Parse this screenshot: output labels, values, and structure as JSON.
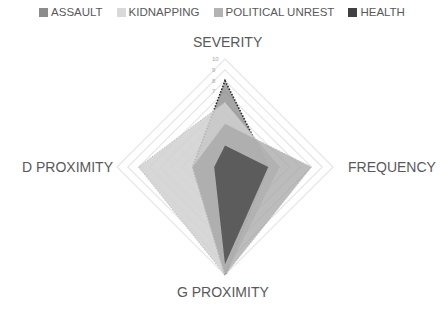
{
  "chart_data": {
    "type": "radar",
    "title": "",
    "categories": [
      "SEVERITY",
      "FREQUENCY",
      "G PROXIMITY",
      "D PROXIMITY"
    ],
    "range": [
      0,
      10
    ],
    "ticks": [
      1,
      2,
      3,
      4,
      5,
      6,
      7,
      8,
      9,
      10
    ],
    "tick_labels_visible": [
      "7",
      "8",
      "9",
      "10"
    ],
    "legend_position": "top",
    "series": [
      {
        "name": "ASSAULT",
        "values": [
          8,
          4,
          10,
          3
        ],
        "color": "#7f7f7f",
        "opacity": 0.7,
        "outline": "dotted"
      },
      {
        "name": "KIDNAPPING",
        "values": [
          6,
          5,
          10,
          8
        ],
        "color": "#d0d0d0",
        "opacity": 0.85,
        "outline": "dotted-light"
      },
      {
        "name": "POLITICAL UNREST",
        "values": [
          4,
          8,
          10,
          3
        ],
        "color": "#a6a6a6",
        "opacity": 0.75,
        "outline": "dotted-light"
      },
      {
        "name": "HEALTH",
        "values": [
          2,
          4,
          9,
          1
        ],
        "color": "#404040",
        "opacity": 0.75,
        "outline": "none"
      }
    ]
  },
  "legend": [
    {
      "label": "ASSAULT",
      "color": "#8c8c8c"
    },
    {
      "label": "KIDNAPPING",
      "color": "#d9d9d9"
    },
    {
      "label": "POLITICAL UNREST",
      "color": "#b3b3b3"
    },
    {
      "label": "HEALTH",
      "color": "#404040"
    }
  ],
  "axes": {
    "top": "SEVERITY",
    "right": "FREQUENCY",
    "bottom": "G PROXIMITY",
    "left": "D PROXIMITY"
  }
}
